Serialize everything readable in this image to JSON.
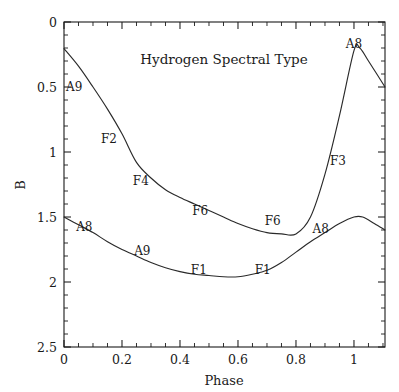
{
  "chart_data": {
    "type": "line",
    "title": "Hydrogen Spectral Type",
    "xlabel": "Phase",
    "ylabel": "B",
    "xlim": [
      0,
      1.107
    ],
    "ylim": [
      2.5,
      0
    ],
    "y_inverted": true,
    "grid": false,
    "legend": null,
    "x_ticks": [
      0,
      0.2,
      0.4,
      0.6,
      0.8,
      1
    ],
    "x_tick_labels": [
      "0",
      "0.2",
      "0.4",
      "0.6",
      "0.8",
      "1"
    ],
    "x_minor_step": 0.05,
    "y_ticks": [
      0,
      0.5,
      1,
      1.5,
      2,
      2.5
    ],
    "y_tick_labels": [
      "0",
      "0.5",
      "1",
      "1.5",
      "2",
      "2.5"
    ],
    "y_minor_step": 0.1,
    "series": [
      {
        "name": "upper-curve",
        "points": [
          [
            0.0,
            0.205
          ],
          [
            0.05,
            0.34
          ],
          [
            0.1,
            0.5
          ],
          [
            0.15,
            0.67
          ],
          [
            0.2,
            0.86
          ],
          [
            0.25,
            1.08
          ],
          [
            0.3,
            1.2
          ],
          [
            0.35,
            1.29
          ],
          [
            0.4,
            1.35
          ],
          [
            0.45,
            1.4
          ],
          [
            0.5,
            1.45
          ],
          [
            0.55,
            1.5
          ],
          [
            0.6,
            1.55
          ],
          [
            0.65,
            1.59
          ],
          [
            0.7,
            1.62
          ],
          [
            0.75,
            1.63
          ],
          [
            0.8,
            1.63
          ],
          [
            0.85,
            1.5
          ],
          [
            0.9,
            1.17
          ],
          [
            0.95,
            0.72
          ],
          [
            1.0,
            0.22
          ],
          [
            1.02,
            0.2
          ],
          [
            1.05,
            0.3
          ],
          [
            1.107,
            0.5
          ]
        ]
      },
      {
        "name": "lower-curve",
        "points": [
          [
            0.0,
            1.5
          ],
          [
            0.05,
            1.56
          ],
          [
            0.1,
            1.62
          ],
          [
            0.15,
            1.69
          ],
          [
            0.2,
            1.75
          ],
          [
            0.25,
            1.8
          ],
          [
            0.3,
            1.85
          ],
          [
            0.35,
            1.89
          ],
          [
            0.4,
            1.92
          ],
          [
            0.45,
            1.94
          ],
          [
            0.5,
            1.95
          ],
          [
            0.55,
            1.96
          ],
          [
            0.6,
            1.96
          ],
          [
            0.65,
            1.94
          ],
          [
            0.7,
            1.91
          ],
          [
            0.75,
            1.85
          ],
          [
            0.8,
            1.77
          ],
          [
            0.85,
            1.69
          ],
          [
            0.9,
            1.62
          ],
          [
            0.95,
            1.55
          ],
          [
            1.0,
            1.5
          ],
          [
            1.03,
            1.5
          ],
          [
            1.07,
            1.55
          ],
          [
            1.107,
            1.6
          ]
        ]
      }
    ],
    "annotations": [
      {
        "text": "A9",
        "x": 0.035,
        "y": 0.5,
        "series": "upper-curve"
      },
      {
        "text": "F2",
        "x": 0.155,
        "y": 0.9,
        "series": "upper-curve"
      },
      {
        "text": "F4",
        "x": 0.265,
        "y": 1.22,
        "series": "upper-curve"
      },
      {
        "text": "F6",
        "x": 0.47,
        "y": 1.45,
        "series": "upper-curve"
      },
      {
        "text": "F6",
        "x": 0.72,
        "y": 1.53,
        "series": "upper-curve"
      },
      {
        "text": "F3",
        "x": 0.945,
        "y": 1.07,
        "series": "upper-curve"
      },
      {
        "text": "A8",
        "x": 1.0,
        "y": 0.17,
        "series": "upper-curve"
      },
      {
        "text": "A8",
        "x": 0.07,
        "y": 1.58,
        "series": "lower-curve"
      },
      {
        "text": "A9",
        "x": 0.27,
        "y": 1.76,
        "series": "lower-curve"
      },
      {
        "text": "F1",
        "x": 0.465,
        "y": 1.91,
        "series": "lower-curve"
      },
      {
        "text": "F1",
        "x": 0.685,
        "y": 1.91,
        "series": "lower-curve"
      },
      {
        "text": "A8",
        "x": 0.885,
        "y": 1.59,
        "series": "lower-curve"
      }
    ]
  },
  "colors": {
    "background": "#ffffff",
    "axis": "#1a1a1a",
    "curve": "#2a2a2a",
    "text": "#1a1a1a"
  }
}
